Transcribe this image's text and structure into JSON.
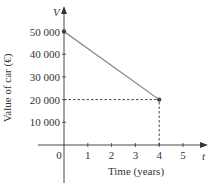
{
  "chart_data": {
    "type": "line",
    "title": "",
    "xlabel": "Time (years)",
    "ylabel": "Value of car (€)",
    "x_axis_symbol": "t",
    "y_axis_symbol": "V",
    "x_ticks": [
      "0",
      "1",
      "2",
      "3",
      "4",
      "5"
    ],
    "y_ticks": [
      "10 000",
      "20 000",
      "30 000",
      "40 000",
      "50 000"
    ],
    "xlim": [
      0,
      5.8
    ],
    "ylim": [
      0,
      55000
    ],
    "grid": false,
    "series": [
      {
        "name": "Value of car",
        "x": [
          0,
          4
        ],
        "y": [
          50000,
          20000
        ],
        "markers": true
      }
    ],
    "annotations": [
      {
        "type": "dashed-guide",
        "from": [
          0,
          20000
        ],
        "to": [
          4,
          20000
        ]
      },
      {
        "type": "dashed-guide",
        "from": [
          4,
          0
        ],
        "to": [
          4,
          20000
        ]
      }
    ]
  },
  "colors": {
    "axis": "#333333",
    "line": "#7a7a7a",
    "point": "#444444",
    "text": "#333333"
  }
}
